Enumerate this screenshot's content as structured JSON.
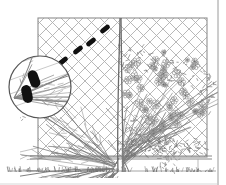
{
  "figure": {
    "title": "Fan-trained climbing plant on lattice trellis",
    "caption": "",
    "width": 226,
    "height": 185,
    "background_color": "#ffffff",
    "ink_color": "#555555",
    "marker_color": "#101010",
    "style": "pen-and-ink line drawing, grayscale, no text labels"
  },
  "frame": {
    "right_border_color": "#9a9a9a",
    "right_border_x": 218,
    "bottom_border_color": "#b5b5b5"
  },
  "trellis": {
    "name": "lattice-trellis-panel",
    "left": 38,
    "top": 18,
    "right": 207,
    "bottom": 157,
    "frame_color": "#8e8e8e",
    "lattice_color": "#a8a8a8",
    "lattice_spacing": 13,
    "lattice_angle_degrees": 45,
    "post_color": "#9e9e9e"
  },
  "rail": {
    "name": "bottom-rail",
    "y": 156,
    "color": "#8a8a8a",
    "posts_x": [
      38,
      104,
      198
    ],
    "post_bottom_y": 170
  },
  "ground": {
    "name": "ground-grass-line",
    "y": 171,
    "color": "#6f6f6f",
    "tuft_count": 110
  },
  "tree": {
    "name": "central-trunk",
    "base_x": 120,
    "base_y": 172,
    "top_y": 18,
    "trunk_color": "#6a6a6a",
    "trunk_width": 5
  },
  "left_half": {
    "name": "bare-branch-canopy",
    "description": "dormant fan-trained branches, no foliage",
    "branch_count": 46,
    "branch_color": "#777777"
  },
  "right_half": {
    "name": "flowering-canopy",
    "description": "leafed and flowering growth with blossom clusters",
    "blossom_count": 70,
    "blossom_color": "#8c8c8c",
    "foliage_color": "#7d7d7d"
  },
  "ties": {
    "name": "tie-markers",
    "color": "#111111",
    "count": 4,
    "angle_degrees": -38,
    "length": 11,
    "thickness": 5,
    "positions": [
      {
        "x": 63,
        "y": 61
      },
      {
        "x": 78,
        "y": 50
      },
      {
        "x": 91,
        "y": 42
      },
      {
        "x": 105,
        "y": 29
      }
    ]
  },
  "magnifier": {
    "name": "detail-magnifier-circle",
    "center_x": 40,
    "center_y": 87,
    "radius": 32,
    "ring_color": "#555555",
    "ring_width": 1.2,
    "fill": "#ffffff",
    "content_description": "enlarged view of two ties fastening stems to the trellis wire",
    "tie_count": 2,
    "tie_positions": [
      {
        "x": 34,
        "y": 79
      },
      {
        "x": 27,
        "y": 94
      }
    ],
    "stem_count": 14
  }
}
